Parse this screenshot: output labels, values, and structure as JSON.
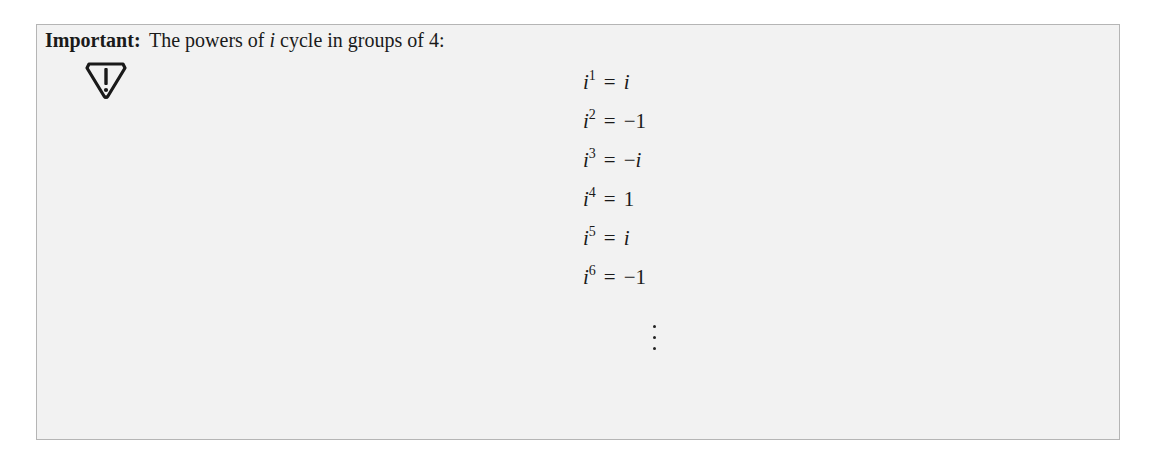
{
  "callout": {
    "label": "Important:",
    "icon": "warning-triangle-icon",
    "intro_prefix": "The powers of ",
    "intro_var": "i",
    "intro_suffix": " cycle in groups of 4:",
    "equations": [
      {
        "base": "i",
        "exp": "1",
        "op": "=",
        "rhs_sign": "",
        "rhs": "i",
        "rhs_italic": true
      },
      {
        "base": "i",
        "exp": "2",
        "op": "=",
        "rhs_sign": "−",
        "rhs": "1",
        "rhs_italic": false
      },
      {
        "base": "i",
        "exp": "3",
        "op": "=",
        "rhs_sign": "−",
        "rhs": "i",
        "rhs_italic": true
      },
      {
        "base": "i",
        "exp": "4",
        "op": "=",
        "rhs_sign": "",
        "rhs": "1",
        "rhs_italic": false
      },
      {
        "base": "i",
        "exp": "5",
        "op": "=",
        "rhs_sign": "",
        "rhs": "i",
        "rhs_italic": true
      },
      {
        "base": "i",
        "exp": "6",
        "op": "=",
        "rhs_sign": "−",
        "rhs": "1",
        "rhs_italic": false
      }
    ],
    "continuation": "⋮"
  },
  "colors": {
    "box_background": "#f2f2f2",
    "box_border": "#b5b5b5",
    "text": "#1a1a1a"
  }
}
